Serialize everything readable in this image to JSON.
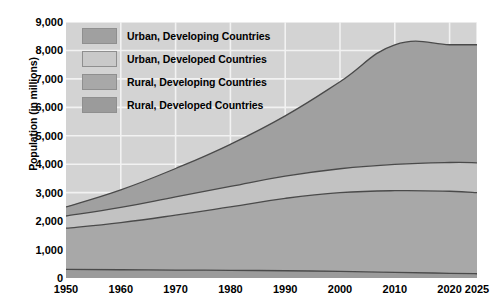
{
  "chart_data": {
    "type": "area",
    "title": "",
    "subtitle": "",
    "xlabel": "",
    "ylabel": "Population (in millions)",
    "stacked": true,
    "grid": true,
    "legend_position": "inside-top-left",
    "xlim": [
      1950,
      2025
    ],
    "ylim": [
      0,
      9000
    ],
    "x_ticks": [
      "1950",
      "1960",
      "1970",
      "1980",
      "1990",
      "2000",
      "2010",
      "2020",
      "2025"
    ],
    "x": [
      1950,
      1960,
      1970,
      1980,
      1990,
      2000,
      2010,
      2020,
      2025
    ],
    "y_ticks": [
      "0",
      "1,000",
      "2,000",
      "3,000",
      "4,000",
      "5,000",
      "6,000",
      "7,000",
      "8,000",
      "9,000"
    ],
    "y_tick_values": [
      0,
      1000,
      2000,
      3000,
      4000,
      5000,
      6000,
      7000,
      8000,
      9000
    ],
    "series": [
      {
        "name": "Rural, Developed Countries",
        "color": "#9b9b9b",
        "values": [
          300,
          290,
          280,
          270,
          255,
          235,
          200,
          165,
          150
        ]
      },
      {
        "name": "Rural, Developing Countries",
        "color": "#a8a8a8",
        "values": [
          1450,
          1660,
          1930,
          2230,
          2545,
          2765,
          2870,
          2885,
          2850
        ]
      },
      {
        "name": "Urban, Developed Countries",
        "color": "#c2c2c2",
        "values": [
          430,
          530,
          640,
          720,
          780,
          840,
          925,
          1010,
          1050
        ]
      },
      {
        "name": "Urban, Developing Countries",
        "color": "#a0a0a0",
        "values": [
          320,
          620,
          1000,
          1480,
          2120,
          3060,
          4205,
          6140,
          7150
        ]
      }
    ],
    "totals": [
      2500,
      3100,
      3850,
      4700,
      5700,
      6900,
      8200,
      10200,
      11200
    ],
    "cumulative_boundaries": {
      "rural_developed_top": [
        300,
        290,
        280,
        270,
        255,
        235,
        200,
        165,
        150
      ],
      "rural_total_top": [
        1750,
        1950,
        2210,
        2500,
        2800,
        3000,
        3070,
        3050,
        3000
      ],
      "rural_plus_urban_developed_top": [
        2180,
        2480,
        2850,
        3220,
        3580,
        3840,
        3995,
        4060,
        4050
      ],
      "grand_total_top": [
        2500,
        3100,
        3850,
        4700,
        5700,
        6900,
        8200,
        8200,
        8200
      ]
    }
  },
  "legend": {
    "items": [
      {
        "label": "Urban, Developing Countries",
        "color": "#a0a0a0"
      },
      {
        "label": "Urban, Developed Countries",
        "color": "#c9c9c9"
      },
      {
        "label": "Rural, Developing Countries",
        "color": "#a8a8a8"
      },
      {
        "label": "Rural, Developed Countries",
        "color": "#9b9b9b"
      }
    ]
  },
  "axes": {
    "y_title": "Population (in millions)"
  },
  "colors": {
    "plot_background": "#d3d3d3",
    "gridline": "#f2f2f2",
    "curve_stroke": "#4a4a4a",
    "page_background": "#ffffff",
    "text": "#000000"
  }
}
